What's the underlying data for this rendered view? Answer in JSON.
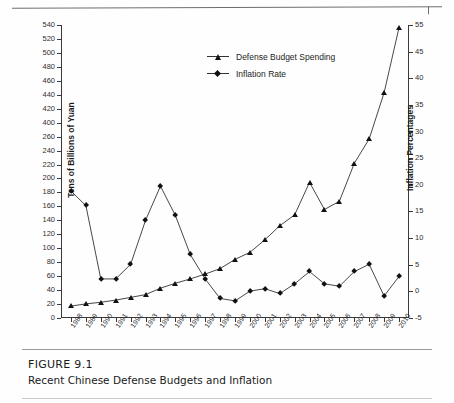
{
  "figure": {
    "number_label": "FIGURE 9.1",
    "caption": "Recent Chinese Defense Budgets and Inflation"
  },
  "legend": {
    "position": "top-center",
    "entries": [
      {
        "label": "Defense Budget Spending",
        "marker": "triangle-marker-icon"
      },
      {
        "label": "Inflation Rate",
        "marker": "diamond-marker-icon"
      }
    ]
  },
  "axes": {
    "left_title": "Tens of Billions of Yuan",
    "right_title": "Inflation Percentages",
    "left_tick_labels": [
      "540",
      "520",
      "500",
      "480",
      "460",
      "440",
      "420",
      "400",
      "260",
      "240",
      "220",
      "200",
      "180",
      "160",
      "140",
      "120",
      "100",
      "80",
      "60",
      "40",
      "20",
      "0"
    ],
    "right_tick_labels": [
      "55",
      "45",
      "40",
      "35",
      "30",
      "25",
      "20",
      "15",
      "10",
      "5",
      "0",
      "-5"
    ],
    "x_tick_labels": [
      "1988",
      "1989",
      "1990",
      "1991",
      "1992",
      "1993",
      "1994",
      "1995",
      "1996",
      "1997",
      "1998",
      "1999",
      "2000",
      "2001",
      "2002",
      "2003",
      "2004",
      "2005",
      "2006",
      "2007",
      "2008",
      "2009",
      "2010"
    ]
  },
  "chart_data": {
    "type": "line",
    "title": "Recent Chinese Defense Budgets and Inflation",
    "xlabel": "",
    "ylabel": "Tens of Billions of Yuan",
    "y2label": "Inflation Percentages",
    "grid": false,
    "legend_position": "top-center",
    "x": [
      "1988",
      "1989",
      "1990",
      "1991",
      "1992",
      "1993",
      "1994",
      "1995",
      "1996",
      "1997",
      "1998",
      "1999",
      "2000",
      "2001",
      "2002",
      "2003",
      "2004",
      "2005",
      "2006",
      "2007",
      "2008",
      "2009",
      "2010"
    ],
    "ylim": [
      0,
      540
    ],
    "y2lim": [
      -5,
      55
    ],
    "series": [
      {
        "name": "Defense Budget Spending",
        "axis": "left",
        "marker": "triangle",
        "units": "Tens of Billions of Yuan",
        "values": [
          22,
          26,
          29,
          33,
          38,
          43,
          55,
          64,
          72,
          81,
          91,
          108,
          121,
          144,
          170,
          190,
          250,
          200,
          215,
          285,
          330,
          415,
          535
        ]
      },
      {
        "name": "Inflation Rate",
        "axis": "right",
        "marker": "diamond",
        "units": "percent",
        "values": [
          21,
          18,
          3,
          3,
          6,
          15,
          22,
          16,
          8,
          3,
          -1,
          -1.5,
          0.5,
          1,
          0,
          2,
          4.5,
          2,
          1.5,
          4.5,
          6,
          -0.5,
          3.5
        ]
      }
    ]
  }
}
